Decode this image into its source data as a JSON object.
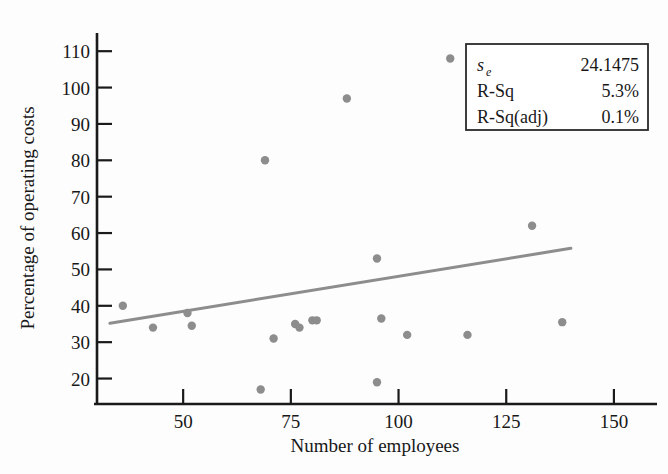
{
  "chart_data": {
    "type": "scatter",
    "title": "",
    "xlabel": "Number of employees",
    "ylabel": "Percentage of operating costs",
    "xlim": [
      30,
      160
    ],
    "ylim": [
      13,
      115
    ],
    "xticks": [
      50,
      75,
      100,
      125,
      150
    ],
    "yticks": [
      20,
      30,
      40,
      50,
      60,
      70,
      80,
      90,
      100,
      110
    ],
    "grid": false,
    "legend": "none",
    "point_color": "#8d8d8d",
    "line_color": "#8d8d8d",
    "axis_color": "#1a1a1a",
    "points": [
      {
        "x": 36,
        "y": 40
      },
      {
        "x": 43,
        "y": 34
      },
      {
        "x": 51,
        "y": 38
      },
      {
        "x": 52,
        "y": 34.5
      },
      {
        "x": 68,
        "y": 17
      },
      {
        "x": 69,
        "y": 80
      },
      {
        "x": 71,
        "y": 31
      },
      {
        "x": 76,
        "y": 35
      },
      {
        "x": 77,
        "y": 34
      },
      {
        "x": 80,
        "y": 36
      },
      {
        "x": 81,
        "y": 36
      },
      {
        "x": 88,
        "y": 97
      },
      {
        "x": 95,
        "y": 53
      },
      {
        "x": 95,
        "y": 19
      },
      {
        "x": 96,
        "y": 36.5
      },
      {
        "x": 102,
        "y": 32
      },
      {
        "x": 112,
        "y": 108
      },
      {
        "x": 116,
        "y": 32
      },
      {
        "x": 131,
        "y": 62
      },
      {
        "x": 138,
        "y": 35.5
      }
    ],
    "fit_line": {
      "label": "regression-line",
      "x1": 33,
      "y1": 35.2,
      "x2": 140,
      "y2": 55.8
    },
    "annotations": {
      "stats_box": {
        "rows": [
          {
            "label": "s",
            "sublabel": "e",
            "value": "24.1475"
          },
          {
            "label": "R-Sq",
            "sublabel": "",
            "value": "5.3%"
          },
          {
            "label": "R-Sq(adj)",
            "sublabel": "",
            "value": "0.1%"
          }
        ]
      }
    }
  }
}
